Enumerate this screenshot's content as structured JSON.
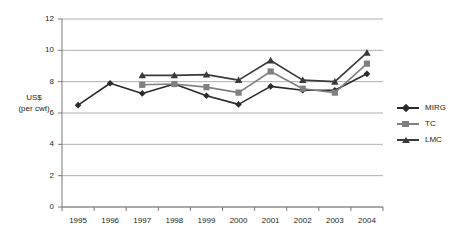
{
  "chart_data": {
    "type": "line",
    "title": "",
    "xlabel": "",
    "ylabel": "US$ (per cwt)",
    "ylabel_line1": "US$",
    "ylabel_line2": "(per cwt)",
    "categories": [
      "1995",
      "1996",
      "1997",
      "1998",
      "1999",
      "2000",
      "2001",
      "2002",
      "2003",
      "2004"
    ],
    "yticks": [
      "0",
      "2",
      "4",
      "6",
      "8",
      "10",
      "12"
    ],
    "ylim": [
      0,
      12
    ],
    "grid": "horizontal",
    "legend_position": "right",
    "series": [
      {
        "name": "MIRG",
        "marker": "diamond",
        "color": "#2b2b2b",
        "values": [
          6.5,
          7.9,
          7.25,
          7.85,
          7.1,
          6.55,
          7.7,
          7.45,
          7.45,
          8.5
        ]
      },
      {
        "name": "TC",
        "marker": "square",
        "color": "#808080",
        "values": [
          null,
          null,
          7.8,
          7.85,
          7.65,
          7.3,
          8.65,
          7.55,
          7.3,
          9.15
        ]
      },
      {
        "name": "LMC",
        "marker": "triangle",
        "color": "#3a3a3a",
        "values": [
          null,
          null,
          8.4,
          8.4,
          8.45,
          8.1,
          9.35,
          8.1,
          8.0,
          9.85
        ]
      }
    ]
  },
  "legend": {
    "entries": [
      {
        "label": "MIRG"
      },
      {
        "label": "TC"
      },
      {
        "label": "LMC"
      }
    ]
  }
}
